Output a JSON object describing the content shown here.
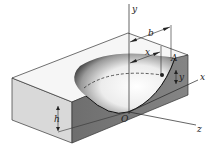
{
  "figure": {
    "colors": {
      "background": "#ffffff",
      "top_face": "#f4f4f4",
      "left_face": "#d8d8d8",
      "front_face": "#7a7a7a",
      "edge": "#333333",
      "bowl_light": "#fafafa",
      "bowl_dark": "#5a5a5a"
    },
    "labels": {
      "y_axis": "y",
      "x_axis": "x",
      "z_axis": "z",
      "origin": "O",
      "point": "A",
      "dim_b": "b",
      "dim_x": "x",
      "dim_y": "y",
      "dim_h": "h"
    }
  }
}
